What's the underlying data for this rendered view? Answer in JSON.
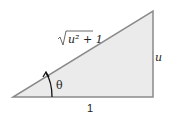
{
  "diagram": {
    "type": "right-triangle",
    "labels": {
      "hypotenuse": "u² + 1",
      "opposite": "u",
      "adjacent": "1",
      "angle": "θ"
    },
    "colors": {
      "fill": "#ebebeb",
      "stroke": "#8a8a8a",
      "text": "#222222"
    }
  }
}
